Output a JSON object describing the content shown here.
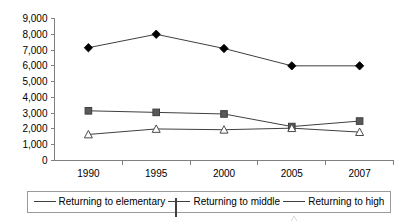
{
  "chart_data": {
    "type": "line",
    "title": "",
    "xlabel": "",
    "ylabel": "",
    "categories": [
      "1990",
      "1995",
      "2000",
      "2005",
      "2007"
    ],
    "ylim": [
      0,
      9000
    ],
    "ytick_step": 1000,
    "ytick_labels": [
      "0",
      "1,000",
      "2,000",
      "3,000",
      "4,000",
      "5,000",
      "6,000",
      "7,000",
      "8,000",
      "9,000"
    ],
    "grid": false,
    "legend_position": "bottom",
    "series": [
      {
        "name": "Returning to elementary",
        "marker": "diamond",
        "color": "#000000",
        "values": [
          7150,
          8000,
          7100,
          6000,
          6000
        ]
      },
      {
        "name": "Returning to middle",
        "marker": "square",
        "color": "#595959",
        "values": [
          3150,
          3050,
          2950,
          2150,
          2500
        ]
      },
      {
        "name": "Returning to high",
        "marker": "triangle",
        "color": "#ffffff",
        "values": [
          1650,
          2000,
          1950,
          2050,
          1800
        ]
      }
    ]
  },
  "legend": {
    "items": [
      {
        "label": "Returning to elementary",
        "marker": "diamond"
      },
      {
        "label": "Returning to middle",
        "marker": "square"
      },
      {
        "label": "Returning to high",
        "marker": "triangle"
      }
    ]
  }
}
